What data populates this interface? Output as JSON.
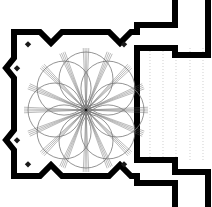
{
  "figure": {
    "kind": "architectural-floor-plan",
    "title": "",
    "width": 212,
    "height": 207,
    "background_color": "#ffffff"
  },
  "colors": {
    "wall": "#000000",
    "background": "#ffffff",
    "thin_line": "#555555",
    "petal_outline": "#777777",
    "dotted_guide": "#bbbbbb",
    "pier": "#1a1a1a"
  },
  "walls": {
    "stroke_color": "#000000",
    "thickness_px": 6,
    "outline_path": "M 14 32 L 40 32 L 51 43 L 62 32 L 109 32 L 120 43 L 131 32 L 137 32 L 137 25 L 175 25 L 175 -10 L 208 -10 L 208 55 L 175 55 L 175 48 L 137 48 L 137 160 L 175 160 L 175 172 L 208 172 L 208 215 L 175 215 L 175 183 L 137 183 L 137 176 L 131 176 L 120 165 L 109 176 L 62 176 L 51 165 L 40 176 L 14 176 L 14 150 L 6 140 L 14 130 L 14 78 L 6 68 L 14 58 Z",
    "notches": [
      {
        "name": "top-notch-left",
        "x": 51,
        "y": 43
      },
      {
        "name": "top-notch-right",
        "x": 120,
        "y": 43
      },
      {
        "name": "bottom-notch-left",
        "x": 51,
        "y": 165
      },
      {
        "name": "bottom-notch-right",
        "x": 120,
        "y": 165
      },
      {
        "name": "left-notch-upper",
        "x": 6,
        "y": 68
      },
      {
        "name": "left-notch-lower",
        "x": 6,
        "y": 140
      }
    ]
  },
  "chamber": {
    "name": "main-square-chamber",
    "interior": {
      "x": 17,
      "y": 35,
      "width": 117,
      "height": 138
    }
  },
  "corridor": {
    "name": "right-corridor",
    "x": 137,
    "y": 48,
    "width": 71,
    "height": 112,
    "dotted_guides_x": [
      150,
      163,
      176,
      190,
      203
    ],
    "dotted_guide_color": "#bbbbbb"
  },
  "rosette": {
    "name": "eight-petal-vault-rosette",
    "center": {
      "x": 86,
      "y": 110
    },
    "petal_count": 8,
    "petal_radius": 27,
    "petal_center_distance": 31,
    "outline_color": "#777777",
    "outline_width": 0.8,
    "start_angle_deg": -90,
    "spokes": {
      "count": 16,
      "lines_per_bundle": 4,
      "color": "#555555",
      "width": 0.4,
      "length": 62
    }
  },
  "piers": [
    {
      "name": "pier-top-left",
      "x": 28,
      "y": 44
    },
    {
      "name": "pier-top-right",
      "x": 124,
      "y": 44
    },
    {
      "name": "pier-bottom-left",
      "x": 28,
      "y": 164
    },
    {
      "name": "pier-bottom-right",
      "x": 124,
      "y": 164
    },
    {
      "name": "pier-left-upper",
      "x": 17,
      "y": 68
    },
    {
      "name": "pier-left-lower",
      "x": 17,
      "y": 140
    }
  ],
  "legend": {
    "items": []
  }
}
